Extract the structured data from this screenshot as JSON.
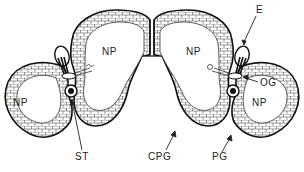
{
  "figure": {
    "colors": {
      "ink": "#222222",
      "background": "#ffffff",
      "cell_fill": "#ffffff"
    }
  },
  "labels": {
    "np_left_outer": "NP",
    "np_left_inner": "NP",
    "np_right_inner": "NP",
    "np_right_outer": "NP",
    "e": "E",
    "og": "OG",
    "st": "ST",
    "cpg": "CPG",
    "pg": "PG"
  }
}
